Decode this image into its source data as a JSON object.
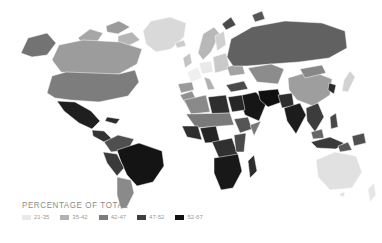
{
  "legend": {
    "title": "PERCENTAGE OF TOTAL",
    "items": [
      {
        "label": "21-35",
        "color": "#e9e9e9"
      },
      {
        "label": "35-42",
        "color": "#b2b2b2"
      },
      {
        "label": "42-47",
        "color": "#7c7c7c"
      },
      {
        "label": "47-52",
        "color": "#3e3e3e"
      },
      {
        "label": "52-67",
        "color": "#121212"
      }
    ]
  },
  "map": {
    "type": "world-choropleth",
    "ocean_color": "#ffffff",
    "regions": [
      {
        "name": "greenland",
        "fill": "#d9d9d9",
        "d": "M146,44 L143,31 L151,21 L170,17 L186,23 L184,37 L171,49 L156,52 Z"
      },
      {
        "name": "canadian-arctic-west",
        "fill": "#a6a6a6",
        "d": "M78,38 L90,29 L103,33 L97,42 L82,43 Z"
      },
      {
        "name": "canadian-arctic-east",
        "fill": "#9b9b9b",
        "d": "M106,26 L119,21 L130,27 L118,34 L107,32 Z"
      },
      {
        "name": "baffin-island",
        "fill": "#b5b5b5",
        "d": "M118,36 L132,32 L140,40 L128,46 L118,44 Z"
      },
      {
        "name": "alaska",
        "fill": "#737373",
        "d": "M21,53 L28,38 L47,33 L56,43 L47,55 L32,57 Z"
      },
      {
        "name": "canada",
        "fill": "#9c9c9c",
        "d": "M52,60 L59,45 L83,40 L120,42 L142,49 L137,64 L119,74 L87,76 L61,72 Z"
      },
      {
        "name": "usa",
        "fill": "#7d7d7d",
        "d": "M47,93 L52,76 L66,72 L119,74 L135,70 L139,82 L128,96 L99,102 L70,100 L55,98 Z"
      },
      {
        "name": "mexico",
        "fill": "#1f1f1f",
        "d": "M57,101 L75,102 L91,111 L100,121 L92,129 L79,123 L64,111 Z"
      },
      {
        "name": "central-america",
        "fill": "#333333",
        "d": "M92,130 L104,131 L112,139 L104,142 L93,136 Z"
      },
      {
        "name": "caribbean",
        "fill": "#2b2b2b",
        "d": "M107,117 L120,119 L116,124 L105,121 Z"
      },
      {
        "name": "colombia-venezuela",
        "fill": "#4f4f4f",
        "d": "M104,142 L118,135 L134,139 L128,150 L111,152 Z"
      },
      {
        "name": "brazil",
        "fill": "#141414",
        "d": "M117,150 L139,143 L162,151 L164,166 L153,182 L137,186 L127,175 L121,162 Z"
      },
      {
        "name": "peru-bolivia",
        "fill": "#3a3a3a",
        "d": "M103,152 L117,154 L124,168 L117,176 L107,163 Z"
      },
      {
        "name": "argentina-chile",
        "fill": "#8a8a8a",
        "d": "M117,177 L131,180 L134,193 L127,207 L121,209 L117,195 Z"
      },
      {
        "name": "iceland",
        "fill": "#cccccc",
        "d": "M175,43 L184,40 L186,46 L177,48 Z"
      },
      {
        "name": "uk-ireland",
        "fill": "#c4c4c4",
        "d": "M183,58 L190,53 L192,63 L185,68 Z"
      },
      {
        "name": "norway-sweden",
        "fill": "#b8b8b8",
        "d": "M198,53 L203,34 L214,27 L220,34 L211,52 L203,60 Z"
      },
      {
        "name": "finland",
        "fill": "#d0d0d0",
        "d": "M215,36 L224,31 L226,45 L217,51 Z"
      },
      {
        "name": "france",
        "fill": "#efefef",
        "d": "M187,72 L198,67 L202,78 L191,82 Z"
      },
      {
        "name": "central-europe",
        "fill": "#e9e9e9",
        "d": "M199,63 L211,61 L213,72 L202,74 Z"
      },
      {
        "name": "spain-portugal",
        "fill": "#9a9a9a",
        "d": "M178,84 L192,82 L194,90 L181,93 Z"
      },
      {
        "name": "italy",
        "fill": "#b2b2b2",
        "d": "M204,77 L210,79 L215,89 L208,90 Z"
      },
      {
        "name": "eastern-europe",
        "fill": "#c9c9c9",
        "d": "M213,57 L226,53 L230,69 L215,73 Z"
      },
      {
        "name": "ukraine",
        "fill": "#a3a3a3",
        "d": "M227,67 L242,63 L245,74 L230,76 Z"
      },
      {
        "name": "russia",
        "fill": "#616161",
        "d": "M227,57 L231,39 L252,27 L285,21 L322,23 L345,31 L347,48 L329,58 L299,62 L271,64 L247,66 L233,66 Z"
      },
      {
        "name": "novaya-zemlya",
        "fill": "#4a4a4a",
        "d": "M222,24 L231,17 L236,25 L226,30 Z"
      },
      {
        "name": "severnaya-zemlya",
        "fill": "#565656",
        "d": "M252,15 L262,11 L265,19 L255,22 Z"
      },
      {
        "name": "kazakhstan-central-asia",
        "fill": "#8c8c8c",
        "d": "M248,68 L271,64 L284,69 L278,84 L257,82 Z"
      },
      {
        "name": "turkey",
        "fill": "#4a4a4a",
        "d": "M226,85 L244,81 L248,89 L231,92 Z"
      },
      {
        "name": "saudi-arabia",
        "fill": "#161616",
        "d": "M238,96 L256,92 L266,104 L259,121 L245,115 Z"
      },
      {
        "name": "iran",
        "fill": "#0f0f0f",
        "d": "M258,91 L278,89 L282,102 L268,107 L260,100 Z"
      },
      {
        "name": "afghanistan-pakistan",
        "fill": "#2e2e2e",
        "d": "M278,95 L292,93 L294,106 L282,108 Z"
      },
      {
        "name": "india",
        "fill": "#1c1c1c",
        "d": "M284,108 L300,103 L306,115 L296,134 L287,121 Z"
      },
      {
        "name": "china",
        "fill": "#9e9e9e",
        "d": "M288,78 L311,71 L332,79 L330,95 L313,106 L297,100 L289,90 Z"
      },
      {
        "name": "mongolia",
        "fill": "#878787",
        "d": "M300,69 L322,65 L326,73 L305,78 Z"
      },
      {
        "name": "southeast-asia",
        "fill": "#3c3c3c",
        "d": "M306,108 L318,103 L324,117 L315,132 L307,121 Z"
      },
      {
        "name": "korea",
        "fill": "#2b2b2b",
        "d": "M329,83 L336,85 L334,94 L328,90 Z"
      },
      {
        "name": "japan",
        "fill": "#d2d2d2",
        "d": "M344,80 L350,71 L355,77 L348,92 L342,91 Z"
      },
      {
        "name": "philippines",
        "fill": "#474747",
        "d": "M330,117 L336,113 L338,127 L331,129 Z"
      },
      {
        "name": "malaysia",
        "fill": "#666666",
        "d": "M311,132 L322,129 L324,138 L313,139 Z"
      },
      {
        "name": "indonesia",
        "fill": "#393939",
        "d": "M311,142 L330,137 L344,143 L336,149 L317,148 Z"
      },
      {
        "name": "indonesia-east",
        "fill": "#575757",
        "d": "M338,146 L348,142 L352,150 L340,152 Z"
      },
      {
        "name": "papua-new-guinea",
        "fill": "#4f4f4f",
        "d": "M352,136 L364,133 L366,143 L354,146 Z"
      },
      {
        "name": "morocco",
        "fill": "#919191",
        "d": "M180,95 L192,91 L196,99 L185,103 Z"
      },
      {
        "name": "algeria",
        "fill": "#8a8a8a",
        "d": "M184,100 L206,95 L210,112 L191,114 Z"
      },
      {
        "name": "libya",
        "fill": "#2e2e2e",
        "d": "M208,97 L226,95 L230,113 L212,114 Z"
      },
      {
        "name": "egypt",
        "fill": "#262626",
        "d": "M228,97 L242,95 L245,110 L232,112 Z"
      },
      {
        "name": "sahel",
        "fill": "#7a7a7a",
        "d": "M186,114 L230,113 L234,125 L196,128 Z"
      },
      {
        "name": "west-africa",
        "fill": "#2f2f2f",
        "d": "M182,126 L198,126 L202,140 L187,137 Z"
      },
      {
        "name": "nigeria",
        "fill": "#242424",
        "d": "M200,128 L216,126 L220,142 L205,143 Z"
      },
      {
        "name": "ethiopia",
        "fill": "#555555",
        "d": "M234,119 L248,117 L252,129 L240,133 Z"
      },
      {
        "name": "somalia",
        "fill": "#787878",
        "d": "M250,125 L261,121 L254,136 Z"
      },
      {
        "name": "drc-central-africa",
        "fill": "#303030",
        "d": "M212,142 L232,138 L238,155 L219,158 Z"
      },
      {
        "name": "east-africa",
        "fill": "#4a4a4a",
        "d": "M234,135 L246,133 L244,152 L236,152 Z"
      },
      {
        "name": "southern-africa",
        "fill": "#181818",
        "d": "M214,158 L238,154 L242,171 L233,188 L221,190 L214,173 Z"
      },
      {
        "name": "madagascar",
        "fill": "#2c2c2c",
        "d": "M248,161 L254,155 L257,171 L250,178 Z"
      },
      {
        "name": "australia",
        "fill": "#e1e1e1",
        "d": "M316,160 L335,152 L356,156 L362,172 L352,188 L330,190 L318,177 Z"
      },
      {
        "name": "tasmania",
        "fill": "#e3e3e3",
        "d": "M340,193 L345,192 L344,197 L340,196 Z"
      },
      {
        "name": "new-zealand",
        "fill": "#e6e6e6",
        "d": "M368,189 L374,183 L376,195 L370,202 Z"
      }
    ]
  }
}
